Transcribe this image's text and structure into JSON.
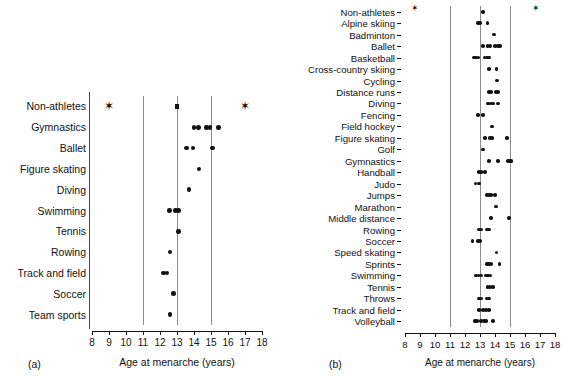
{
  "figure": {
    "axis_title": "Age at menarche (years)",
    "tick_labels": [
      "8",
      "9",
      "10",
      "11",
      "12",
      "13",
      "14",
      "15",
      "16",
      "17",
      "18"
    ],
    "axis_min": 8,
    "axis_max": 18,
    "gridlines": [
      11,
      13,
      15
    ],
    "marker_color": "#111111",
    "gridline_color": "#8c8c8c"
  },
  "panel_a": {
    "tag": "(a)",
    "axis_title": "Age at menarche (years)",
    "rows": [
      {
        "label": "Non-athletes",
        "points": [
          9.0,
          13.0,
          17.0
        ],
        "markers": [
          "star",
          "square",
          "star"
        ]
      },
      {
        "label": "Gymnastics",
        "points": [
          14.0,
          14.25,
          14.75,
          14.95,
          15.45
        ],
        "markers": [
          "dot",
          "dot",
          "dot",
          "dot",
          "dot"
        ]
      },
      {
        "label": "Ballet",
        "points": [
          13.55,
          13.95,
          15.1
        ],
        "markers": [
          "dot",
          "dot",
          "dot"
        ]
      },
      {
        "label": "Figure skating",
        "points": [
          14.3
        ],
        "markers": [
          "dot"
        ]
      },
      {
        "label": "Diving",
        "points": [
          13.7
        ],
        "markers": [
          "dot"
        ]
      },
      {
        "label": "Swimming",
        "points": [
          12.55,
          12.9,
          13.1
        ],
        "markers": [
          "dot",
          "dot",
          "dot"
        ]
      },
      {
        "label": "Tennis",
        "points": [
          13.1
        ],
        "markers": [
          "dot"
        ]
      },
      {
        "label": "Rowing",
        "points": [
          12.6
        ],
        "markers": [
          "dot"
        ]
      },
      {
        "label": "Track and field",
        "points": [
          12.2,
          12.4
        ],
        "markers": [
          "dot",
          "dot"
        ]
      },
      {
        "label": "Soccer",
        "points": [
          12.8
        ],
        "markers": [
          "dot"
        ]
      },
      {
        "label": "Team sports",
        "points": [
          12.6
        ],
        "markers": [
          "dot"
        ]
      }
    ]
  },
  "panel_b": {
    "tag": "(b)",
    "axis_title": "Age at menarche (years)",
    "rows": [
      {
        "label": "Non-athletes",
        "points": [
          8.9,
          13.2,
          17.0
        ],
        "markers": [
          "star",
          "dot",
          "star"
        ]
      },
      {
        "label": "Alpine skiing",
        "points": [
          12.85,
          13.0,
          13.5
        ],
        "markers": [
          "dot",
          "dot",
          "dot"
        ]
      },
      {
        "label": "Badminton",
        "points": [
          13.95
        ],
        "markers": [
          "dot"
        ]
      },
      {
        "label": "Ballet",
        "points": [
          13.2,
          13.5,
          13.65,
          14.0,
          14.2,
          14.35
        ],
        "markers": [
          "dot",
          "dot",
          "dot",
          "dot",
          "dot",
          "dot"
        ]
      },
      {
        "label": "Basketball",
        "points": [
          12.6,
          12.75,
          12.9,
          13.3,
          13.45,
          13.6
        ],
        "markers": [
          "dot",
          "dot",
          "dot",
          "dot",
          "dot",
          "dot"
        ]
      },
      {
        "label": "Cross-country skiing",
        "points": [
          13.6,
          14.1
        ],
        "markers": [
          "dot",
          "dot"
        ]
      },
      {
        "label": "Cycling",
        "points": [
          14.15
        ],
        "markers": [
          "dot"
        ]
      },
      {
        "label": "Distance runs",
        "points": [
          13.6,
          13.75,
          14.05,
          14.2
        ],
        "markers": [
          "dot",
          "dot",
          "dot",
          "dot"
        ]
      },
      {
        "label": "Diving",
        "points": [
          13.55,
          13.7,
          13.85,
          14.2
        ],
        "markers": [
          "dot",
          "dot",
          "dot",
          "dot"
        ]
      },
      {
        "label": "Fencing",
        "points": [
          12.85,
          13.2
        ],
        "markers": [
          "dot",
          "dot"
        ]
      },
      {
        "label": "Field hockey",
        "points": [
          13.8
        ],
        "markers": [
          "dot"
        ]
      },
      {
        "label": "Figure skating",
        "points": [
          13.35,
          13.65,
          13.8,
          14.8
        ],
        "markers": [
          "dot",
          "dot",
          "dot",
          "dot"
        ]
      },
      {
        "label": "Golf",
        "points": [
          13.2
        ],
        "markers": [
          "dot"
        ]
      },
      {
        "label": "Gymnastics",
        "points": [
          13.6,
          14.2,
          14.85,
          15.0,
          15.1
        ],
        "markers": [
          "dot",
          "dot",
          "dot",
          "dot",
          "dot"
        ]
      },
      {
        "label": "Handball",
        "points": [
          12.95,
          13.1,
          13.35
        ],
        "markers": [
          "dot",
          "dot",
          "dot"
        ]
      },
      {
        "label": "Judo",
        "points": [
          12.7,
          12.95
        ],
        "markers": [
          "dot",
          "dot"
        ]
      },
      {
        "label": "Jumps",
        "points": [
          13.45,
          13.6,
          13.75,
          14.0
        ],
        "markers": [
          "dot",
          "dot",
          "dot",
          "dot"
        ]
      },
      {
        "label": "Marathon",
        "points": [
          14.05
        ],
        "markers": [
          "dot"
        ]
      },
      {
        "label": "Middle distance",
        "points": [
          13.75,
          14.95
        ],
        "markers": [
          "dot",
          "dot"
        ]
      },
      {
        "label": "Rowing",
        "points": [
          12.95,
          13.1,
          13.45,
          13.6
        ],
        "markers": [
          "dot",
          "dot",
          "dot",
          "dot"
        ]
      },
      {
        "label": "Soccer",
        "points": [
          12.5,
          12.85,
          13.0
        ],
        "markers": [
          "dot",
          "dot",
          "dot"
        ]
      },
      {
        "label": "Speed skating",
        "points": [
          14.1
        ],
        "markers": [
          "dot"
        ]
      },
      {
        "label": "Sprints",
        "points": [
          13.45,
          13.6,
          13.75,
          14.3
        ],
        "markers": [
          "dot",
          "dot",
          "dot",
          "dot"
        ]
      },
      {
        "label": "Swimming",
        "points": [
          12.75,
          12.9,
          13.05,
          13.4,
          13.55,
          13.7
        ],
        "markers": [
          "dot",
          "dot",
          "dot",
          "dot",
          "dot",
          "dot"
        ]
      },
      {
        "label": "Tennis",
        "points": [
          13.5,
          13.65,
          13.85
        ],
        "markers": [
          "dot",
          "dot",
          "dot"
        ]
      },
      {
        "label": "Throws",
        "points": [
          12.95,
          13.1,
          13.45,
          13.6
        ],
        "markers": [
          "dot",
          "dot",
          "dot",
          "dot"
        ]
      },
      {
        "label": "Track and field",
        "points": [
          12.95,
          13.2,
          13.4,
          13.6
        ],
        "markers": [
          "dot",
          "dot",
          "dot",
          "dot"
        ]
      },
      {
        "label": "Volleyball",
        "points": [
          12.65,
          12.8,
          13.05,
          13.25,
          13.4,
          13.85
        ],
        "markers": [
          "dot",
          "dot",
          "dot",
          "dot",
          "dot",
          "dot"
        ]
      }
    ]
  },
  "chart_data": {
    "type": "scatter",
    "title": "",
    "xlabel": "Age at menarche (years)",
    "ylabel": "",
    "xlim": [
      8,
      18
    ],
    "xticks": [
      8,
      9,
      10,
      11,
      12,
      13,
      14,
      15,
      16,
      17,
      18
    ],
    "grid": true,
    "gridlines_x": [
      11,
      13,
      15
    ],
    "legend": "none",
    "panels": [
      {
        "panel": "(a)",
        "categories": [
          "Non-athletes",
          "Gymnastics",
          "Ballet",
          "Figure skating",
          "Diving",
          "Swimming",
          "Tennis",
          "Rowing",
          "Track and field",
          "Soccer",
          "Team sports"
        ],
        "values": [
          [
            9.0,
            13.0,
            17.0
          ],
          [
            14.0,
            14.25,
            14.75,
            14.95,
            15.45
          ],
          [
            13.55,
            13.95,
            15.1
          ],
          [
            14.3
          ],
          [
            13.7
          ],
          [
            12.55,
            12.9,
            13.1
          ],
          [
            13.1
          ],
          [
            12.6
          ],
          [
            12.2,
            12.4
          ],
          [
            12.8
          ],
          [
            12.6
          ]
        ]
      },
      {
        "panel": "(b)",
        "categories": [
          "Non-athletes",
          "Alpine skiing",
          "Badminton",
          "Ballet",
          "Basketball",
          "Cross-country skiing",
          "Cycling",
          "Distance runs",
          "Diving",
          "Fencing",
          "Field hockey",
          "Figure skating",
          "Golf",
          "Gymnastics",
          "Handball",
          "Judo",
          "Jumps",
          "Marathon",
          "Middle distance",
          "Rowing",
          "Soccer",
          "Speed skating",
          "Sprints",
          "Swimming",
          "Tennis",
          "Throws",
          "Track and field",
          "Volleyball"
        ],
        "values": [
          [
            8.9,
            13.2,
            17.0
          ],
          [
            12.85,
            13.0,
            13.5
          ],
          [
            13.95
          ],
          [
            13.2,
            13.5,
            13.65,
            14.0,
            14.2,
            14.35
          ],
          [
            12.6,
            12.75,
            12.9,
            13.3,
            13.45,
            13.6
          ],
          [
            13.6,
            14.1
          ],
          [
            14.15
          ],
          [
            13.6,
            13.75,
            14.05,
            14.2
          ],
          [
            13.55,
            13.7,
            13.85,
            14.2
          ],
          [
            12.85,
            13.2
          ],
          [
            13.8
          ],
          [
            13.35,
            13.65,
            13.8,
            14.8
          ],
          [
            13.2
          ],
          [
            13.6,
            14.2,
            14.85,
            15.0,
            15.1
          ],
          [
            12.95,
            13.1,
            13.35
          ],
          [
            12.7,
            12.95
          ],
          [
            13.45,
            13.6,
            13.75,
            14.0
          ],
          [
            14.05
          ],
          [
            13.75,
            14.95
          ],
          [
            12.95,
            13.1,
            13.45,
            13.6
          ],
          [
            12.5,
            12.85,
            13.0
          ],
          [
            14.1
          ],
          [
            13.45,
            13.6,
            13.75,
            14.3
          ],
          [
            12.75,
            12.9,
            13.05,
            13.4,
            13.55,
            13.7
          ],
          [
            13.5,
            13.65,
            13.85
          ],
          [
            12.95,
            13.1,
            13.45,
            13.6
          ],
          [
            12.95,
            13.2,
            13.4,
            13.6
          ],
          [
            12.65,
            12.8,
            13.05,
            13.25,
            13.4,
            13.85
          ]
        ]
      }
    ]
  }
}
